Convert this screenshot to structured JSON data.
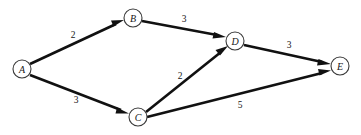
{
  "figure": {
    "type": "directed-weighted-graph",
    "background_color": "#ffffff",
    "line_color": "#111111",
    "node_fill": "#ffffff",
    "node_stroke": "#3a3a3a",
    "text_color": "#161616"
  },
  "nodes": [
    {
      "id": "A",
      "label": "A",
      "x": 22,
      "y": 69,
      "r": 9
    },
    {
      "id": "B",
      "label": "B",
      "x": 133,
      "y": 18,
      "r": 9
    },
    {
      "id": "C",
      "label": "C",
      "x": 138,
      "y": 117,
      "r": 9
    },
    {
      "id": "D",
      "label": "D",
      "x": 235,
      "y": 41,
      "r": 9
    },
    {
      "id": "E",
      "label": "E",
      "x": 340,
      "y": 66,
      "r": 9
    }
  ],
  "edges": [
    {
      "id": "A-B",
      "from": "A",
      "to": "B",
      "weight": "2",
      "label_x": 73,
      "label_y": 35
    },
    {
      "id": "A-C",
      "from": "A",
      "to": "C",
      "weight": "3",
      "label_x": 76,
      "label_y": 100
    },
    {
      "id": "B-D",
      "from": "B",
      "to": "D",
      "weight": "3",
      "label_x": 184,
      "label_y": 19
    },
    {
      "id": "C-D",
      "from": "C",
      "to": "D",
      "weight": "2",
      "label_x": 180,
      "label_y": 76
    },
    {
      "id": "C-E",
      "from": "C",
      "to": "E",
      "weight": "5",
      "label_x": 240,
      "label_y": 105
    },
    {
      "id": "D-E",
      "from": "D",
      "to": "E",
      "weight": "3",
      "label_x": 289,
      "label_y": 45
    }
  ]
}
